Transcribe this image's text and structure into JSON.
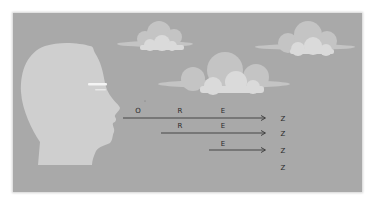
{
  "diagram": {
    "colors": {
      "background": "#a9a9a9",
      "head": "#cfcfcf",
      "cloud_back": "#c4c4c4",
      "cloud_front": "#dadada",
      "arrow": "#3a3a3a"
    },
    "rows": [
      {
        "letters": [
          "O",
          "R",
          "E"
        ],
        "end": "Z"
      },
      {
        "letters": [
          "R",
          "E"
        ],
        "end": "Z"
      },
      {
        "letters": [
          "E"
        ],
        "end": "Z"
      },
      {
        "letters": [],
        "end": "Z"
      }
    ],
    "labels": {
      "row1_o": "O",
      "row1_r": "R",
      "row1_e": "E",
      "row1_z": "Z",
      "row2_r": "R",
      "row2_e": "E",
      "row2_z": "Z",
      "row3_e": "E",
      "row3_z": "Z",
      "row4_z": "Z"
    }
  }
}
